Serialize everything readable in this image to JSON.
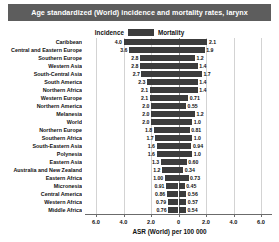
{
  "title": "Age standardized (World) incidence and mortality rates, larynx",
  "legend": {
    "left_label": "Incidence",
    "right_label": "Mortality",
    "swatch_color": "#3c3c3c"
  },
  "axis": {
    "xlabel": "ASR (World) per 100 000",
    "ticks": [
      "6.0",
      "4.0",
      "2.0",
      "0",
      "2.0",
      "4.0",
      "6.0"
    ],
    "max": 6.8
  },
  "colors": {
    "bar": "#3c3c3c",
    "title_bar": "#5d5d5d",
    "grid": "#d3d3d3",
    "axis": "#6b6b6b"
  },
  "chart_data": {
    "type": "bar",
    "title": "Age standardized (World) incidence and mortality rates, larynx",
    "xlabel": "ASR (World) per 100 000",
    "ylabel": "",
    "orientation": "horizontal-diverging",
    "xlim": [
      -6.8,
      6.8
    ],
    "grid": true,
    "legend_position": "top-center",
    "categories": [
      "Caribbean",
      "Central and Eastern Europe",
      "Southern Europe",
      "Western Asia",
      "South-Central Asia",
      "South America",
      "Northern Africa",
      "Western Europe",
      "Northern America",
      "Melanesia",
      "World",
      "Northern Europe",
      "Southern Africa",
      "South-Eastern Asia",
      "Polynesia",
      "Eastern Asia",
      "Australia and New Zealand",
      "Eastern Africa",
      "Micronesia",
      "Central America",
      "Western Africa",
      "Middle Africa"
    ],
    "series": [
      {
        "name": "Incidence",
        "side": "left",
        "values": [
          4.0,
          3.6,
          2.8,
          2.8,
          2.7,
          2.3,
          2.1,
          2.1,
          2.0,
          2.0,
          2.0,
          1.8,
          1.7,
          1.6,
          1.6,
          1.3,
          1.2,
          1.0,
          0.91,
          0.86,
          0.79,
          0.76
        ],
        "labels": [
          "4.0",
          "3.6",
          "2.8",
          "2.8",
          "2.7",
          "2.3",
          "2.1",
          "2.1",
          "2.0",
          "2.0",
          "2.0",
          "1.8",
          "1.7",
          "1.6",
          "1.6",
          "1.3",
          "1.2",
          "1.00",
          "0.91",
          "0.86",
          "0.79",
          "0.76"
        ]
      },
      {
        "name": "Mortality",
        "side": "right",
        "values": [
          2.1,
          1.9,
          1.2,
          1.4,
          1.7,
          1.4,
          1.4,
          0.71,
          0.55,
          1.2,
          1.0,
          0.81,
          1.0,
          0.94,
          1.0,
          0.6,
          0.34,
          0.73,
          0.45,
          0.56,
          0.57,
          0.54
        ],
        "labels": [
          "2.1",
          "1.9",
          "1.2",
          "1.4",
          "1.7",
          "1.4",
          "1.4",
          "0.71",
          "0.55",
          "1.2",
          "1.0",
          "0.81",
          "1.0",
          "0.94",
          "1.0",
          "0.60",
          "0.34",
          "0.73",
          "0.45",
          "0.56",
          "0.57",
          "0.54"
        ]
      }
    ]
  }
}
